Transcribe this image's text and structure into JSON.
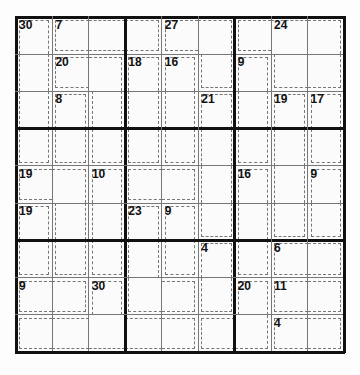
{
  "puzzle": {
    "type": "Killer Sudoku",
    "size": 9,
    "cages": [
      {
        "sum": 30,
        "cells": [
          [
            0,
            0
          ],
          [
            1,
            0
          ],
          [
            2,
            0
          ],
          [
            3,
            0
          ]
        ]
      },
      {
        "sum": 7,
        "cells": [
          [
            0,
            1
          ],
          [
            0,
            2
          ],
          [
            0,
            3
          ]
        ]
      },
      {
        "sum": 27,
        "cells": [
          [
            0,
            4
          ],
          [
            0,
            5
          ],
          [
            1,
            5
          ]
        ]
      },
      {
        "sum": 24,
        "cells": [
          [
            0,
            6
          ],
          [
            0,
            7
          ],
          [
            0,
            8
          ],
          [
            1,
            7
          ],
          [
            1,
            8
          ]
        ]
      },
      {
        "sum": 20,
        "cells": [
          [
            1,
            1
          ],
          [
            1,
            2
          ],
          [
            2,
            2
          ],
          [
            3,
            2
          ]
        ]
      },
      {
        "sum": 18,
        "cells": [
          [
            1,
            3
          ],
          [
            2,
            3
          ],
          [
            3,
            3
          ]
        ]
      },
      {
        "sum": 16,
        "cells": [
          [
            1,
            4
          ],
          [
            2,
            4
          ],
          [
            3,
            4
          ]
        ]
      },
      {
        "sum": 9,
        "cells": [
          [
            1,
            6
          ],
          [
            2,
            6
          ],
          [
            3,
            6
          ]
        ]
      },
      {
        "sum": 8,
        "cells": [
          [
            2,
            1
          ],
          [
            3,
            1
          ]
        ]
      },
      {
        "sum": 21,
        "cells": [
          [
            2,
            5
          ],
          [
            3,
            5
          ],
          [
            4,
            5
          ],
          [
            5,
            5
          ]
        ]
      },
      {
        "sum": 19,
        "cells": [
          [
            2,
            7
          ],
          [
            3,
            7
          ],
          [
            4,
            7
          ],
          [
            5,
            7
          ]
        ]
      },
      {
        "sum": 17,
        "cells": [
          [
            2,
            8
          ],
          [
            3,
            8
          ]
        ]
      },
      {
        "sum": 19,
        "cells": [
          [
            4,
            0
          ],
          [
            4,
            1
          ],
          [
            5,
            1
          ],
          [
            6,
            1
          ]
        ]
      },
      {
        "sum": 10,
        "cells": [
          [
            4,
            2
          ],
          [
            5,
            2
          ],
          [
            6,
            2
          ]
        ]
      },
      {
        "sum": 16,
        "cells": [
          [
            4,
            6
          ],
          [
            5,
            6
          ],
          [
            6,
            6
          ]
        ]
      },
      {
        "sum": 9,
        "cells": [
          [
            4,
            8
          ],
          [
            5,
            8
          ]
        ]
      },
      {
        "sum": 19,
        "cells": [
          [
            5,
            0
          ],
          [
            6,
            0
          ]
        ]
      },
      {
        "sum": 23,
        "cells": [
          [
            5,
            3
          ],
          [
            6,
            3
          ],
          [
            7,
            3
          ],
          [
            7,
            4
          ],
          [
            7,
            5
          ]
        ]
      },
      {
        "sum": 9,
        "cells": [
          [
            5,
            4
          ],
          [
            6,
            4
          ]
        ]
      },
      {
        "sum": 4,
        "cells": [
          [
            6,
            5
          ],
          [
            7,
            5
          ]
        ]
      },
      {
        "sum": 6,
        "cells": [
          [
            6,
            7
          ],
          [
            6,
            8
          ]
        ]
      },
      {
        "sum": 9,
        "cells": [
          [
            7,
            0
          ],
          [
            7,
            1
          ]
        ]
      },
      {
        "sum": 30,
        "cells": [
          [
            7,
            2
          ],
          [
            8,
            0
          ],
          [
            8,
            1
          ],
          [
            8,
            2
          ],
          [
            8,
            3
          ],
          [
            8,
            4
          ]
        ]
      },
      {
        "sum": 20,
        "cells": [
          [
            7,
            6
          ],
          [
            8,
            5
          ],
          [
            8,
            6
          ]
        ]
      },
      {
        "sum": 11,
        "cells": [
          [
            7,
            7
          ],
          [
            7,
            8
          ]
        ]
      },
      {
        "sum": 4,
        "cells": [
          [
            8,
            7
          ],
          [
            8,
            8
          ]
        ]
      }
    ],
    "clues": [
      {
        "row": 0,
        "col": 0,
        "label": "30"
      },
      {
        "row": 0,
        "col": 1,
        "label": "7"
      },
      {
        "row": 0,
        "col": 4,
        "label": "27"
      },
      {
        "row": 0,
        "col": 7,
        "label": "24"
      },
      {
        "row": 1,
        "col": 1,
        "label": "20"
      },
      {
        "row": 1,
        "col": 3,
        "label": "18"
      },
      {
        "row": 1,
        "col": 4,
        "label": "16"
      },
      {
        "row": 1,
        "col": 6,
        "label": "9"
      },
      {
        "row": 2,
        "col": 1,
        "label": "8"
      },
      {
        "row": 2,
        "col": 5,
        "label": "21"
      },
      {
        "row": 2,
        "col": 7,
        "label": "19"
      },
      {
        "row": 2,
        "col": 8,
        "label": "17"
      },
      {
        "row": 4,
        "col": 0,
        "label": "19"
      },
      {
        "row": 4,
        "col": 2,
        "label": "10"
      },
      {
        "row": 4,
        "col": 6,
        "label": "16"
      },
      {
        "row": 4,
        "col": 8,
        "label": "9"
      },
      {
        "row": 5,
        "col": 0,
        "label": "19"
      },
      {
        "row": 5,
        "col": 3,
        "label": "23"
      },
      {
        "row": 5,
        "col": 4,
        "label": "9"
      },
      {
        "row": 6,
        "col": 5,
        "label": "4"
      },
      {
        "row": 6,
        "col": 7,
        "label": "6"
      },
      {
        "row": 7,
        "col": 0,
        "label": "9"
      },
      {
        "row": 7,
        "col": 2,
        "label": "30"
      },
      {
        "row": 7,
        "col": 6,
        "label": "20"
      },
      {
        "row": 7,
        "col": 7,
        "label": "11"
      },
      {
        "row": 8,
        "col": 7,
        "label": "4"
      }
    ]
  }
}
